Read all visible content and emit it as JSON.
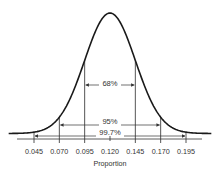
{
  "chart_data": {
    "type": "area",
    "title": "",
    "xlabel": "Proportion",
    "ylabel": "",
    "distribution": "normal",
    "mean": 0.12,
    "std": 0.025,
    "xlim": [
      0.02,
      0.22
    ],
    "ticks": [
      0.045,
      0.07,
      0.095,
      0.12,
      0.145,
      0.17,
      0.195
    ],
    "tick_labels": [
      "0.045",
      "0.070",
      "0.095",
      "0.120",
      "0.145",
      "0.170",
      "0.195"
    ],
    "intervals": [
      {
        "label": "68%",
        "from": 0.095,
        "to": 0.145
      },
      {
        "label": "95%",
        "from": 0.07,
        "to": 0.17
      },
      {
        "label": "99.7%",
        "from": 0.045,
        "to": 0.195
      }
    ],
    "grid": false,
    "legend": "none"
  }
}
